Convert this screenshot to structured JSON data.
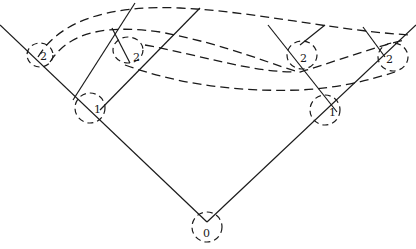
{
  "diagram": {
    "title": "",
    "nodes": [
      {
        "id": "root",
        "label": "0",
        "level": 0
      },
      {
        "id": "left-1",
        "label": "1",
        "level": 1
      },
      {
        "id": "right-1",
        "label": "1",
        "level": 1
      },
      {
        "id": "left-outer-2",
        "label": "2",
        "level": 2
      },
      {
        "id": "left-inner-2",
        "label": "2",
        "level": 2
      },
      {
        "id": "right-inner-2",
        "label": "2",
        "level": 2
      },
      {
        "id": "right-outer-2",
        "label": "2",
        "level": 2
      }
    ],
    "edges": [
      {
        "from": "root",
        "to": "left-1",
        "style": "solid"
      },
      {
        "from": "root",
        "to": "right-1",
        "style": "solid"
      },
      {
        "from": "left-1",
        "to": "left-outer-2",
        "style": "solid"
      },
      {
        "from": "left-1",
        "to": "left-inner-2",
        "style": "solid"
      },
      {
        "from": "right-1",
        "to": "right-inner-2",
        "style": "solid"
      },
      {
        "from": "right-1",
        "to": "right-outer-2",
        "style": "solid"
      }
    ],
    "connections": [
      {
        "from": "left-outer-2",
        "to": "right-outer-2",
        "style": "dashed"
      },
      {
        "from": "left-outer-2",
        "to": "right-inner-2",
        "style": "dashed"
      },
      {
        "from": "left-inner-2",
        "to": "right-inner-2",
        "style": "dashed"
      },
      {
        "from": "left-inner-2",
        "to": "right-outer-2",
        "style": "dashed"
      }
    ]
  }
}
